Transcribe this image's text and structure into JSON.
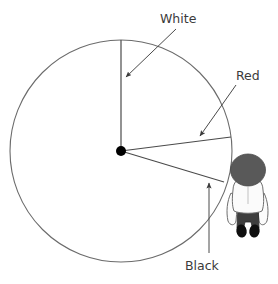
{
  "diagram": {
    "background_color": "#ffffff",
    "stroke_color": "#4a4a4a",
    "text_color": "#3b3b3b"
  },
  "circle": {
    "center_x": 121,
    "center_y": 151,
    "radius": 111,
    "stroke_color": "#6b6b6b",
    "fill": "none"
  },
  "center_dot": {
    "x": 121,
    "y": 151,
    "radius": 5,
    "color": "#000000"
  },
  "radii": [
    {
      "name": "vertical-radius-top",
      "x1": 121,
      "y1": 151,
      "x2": 121,
      "y2": 40
    },
    {
      "name": "radius-red-upper",
      "x1": 121,
      "y1": 151,
      "x2": 231,
      "y2": 137
    },
    {
      "name": "radius-red-lower",
      "x1": 121,
      "y1": 151,
      "x2": 224,
      "y2": 182
    }
  ],
  "labels": [
    {
      "id": "white",
      "text": "White",
      "text_x": 160,
      "text_y": 19,
      "leader": {
        "x1": 176,
        "y1": 29,
        "x2": 124,
        "y2": 79
      },
      "arrow_at": {
        "x": 124,
        "y": 79
      }
    },
    {
      "id": "red",
      "text": "Red",
      "text_x": 236,
      "text_y": 76,
      "leader": {
        "x1": 236,
        "y1": 85,
        "x2": 198,
        "y2": 138
      },
      "arrow_at": {
        "x": 198,
        "y": 138
      }
    },
    {
      "id": "black",
      "text": "Black",
      "text_x": 185,
      "text_y": 266,
      "leader": {
        "x1": 209,
        "y1": 253,
        "x2": 209,
        "y2": 181
      },
      "arrow_at": {
        "x": 209,
        "y": 181
      }
    }
  ],
  "observer": {
    "name": "person-figure",
    "description": "Top-down view of a person standing outside the circle to the right",
    "head_color": "#595959",
    "jacket_color": "#fbfbfb",
    "jacket_outline": "#6e6e6e",
    "pants_color": "#3e3e3e",
    "shoes_color": "#0f0f0f",
    "x": 248,
    "y": 196
  },
  "colors": {
    "white_sector": "#ffffff",
    "red_sector": "#ffffff",
    "black_sector": "#ffffff",
    "outline": "#6b6b6b"
  }
}
